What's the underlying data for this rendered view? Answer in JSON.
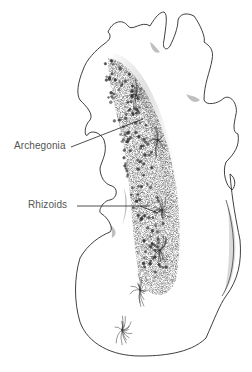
{
  "figure": {
    "labels": [
      {
        "id": "archegonia",
        "text": "Archegonia"
      },
      {
        "id": "rhizoids",
        "text": "Rhizoids"
      }
    ],
    "colors": {
      "outline": "#2a2a2a",
      "stipple": "#6a6a6a",
      "label_text": "#555555",
      "leader_line": "#222222",
      "background": "#ffffff"
    }
  }
}
